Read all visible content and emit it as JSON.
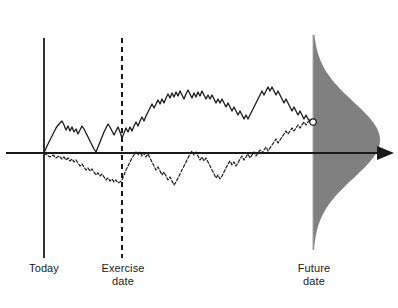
{
  "figure": {
    "background_color": "#ffffff",
    "ink_color": "#1a1a1a",
    "distribution_fill_color": "#808080"
  },
  "labels": {
    "today": "Today",
    "exercise_date": "Exercise\ndate",
    "future_date": "Future\ndate"
  },
  "caption": {
    "partial_text": ""
  },
  "chart_data": {
    "type": "line",
    "title": "",
    "xlabel": "",
    "ylabel": "",
    "grid": false,
    "legend_position": "none",
    "axis": {
      "horizontal_y_px": 153,
      "x_start_px": 6,
      "x_end_px": 394,
      "arrow_at_end": true
    },
    "markers": [
      {
        "name": "today-line",
        "label": "Today",
        "x_px": 44,
        "style": "solid-vertical",
        "y_top_px": 38,
        "y_bottom_px": 258
      },
      {
        "name": "exercise-date-line",
        "label": "Exercise date",
        "x_px": 122,
        "style": "dashed-vertical",
        "y_top_px": 38,
        "y_bottom_px": 258
      },
      {
        "name": "future-date-line",
        "label": "Future date",
        "x_px": 313,
        "style": "thin-vertical",
        "y_top_px": 35,
        "y_bottom_px": 250
      }
    ],
    "endpoint_marker": {
      "name": "path-endpoint",
      "x_px": 313,
      "y_px": 122,
      "shape": "open-circle"
    },
    "series": [
      {
        "name": "upper-path-solid",
        "style": "solid",
        "points_px": [
          [
            44,
            153
          ],
          [
            47,
            146
          ],
          [
            50,
            140
          ],
          [
            53,
            134
          ],
          [
            56,
            128
          ],
          [
            59,
            124
          ],
          [
            62,
            121
          ],
          [
            64,
            125
          ],
          [
            66,
            130
          ],
          [
            68,
            126
          ],
          [
            70,
            131
          ],
          [
            72,
            127
          ],
          [
            74,
            132
          ],
          [
            76,
            129
          ],
          [
            78,
            134
          ],
          [
            80,
            130
          ],
          [
            82,
            126
          ],
          [
            84,
            129
          ],
          [
            86,
            133
          ],
          [
            88,
            137
          ],
          [
            90,
            141
          ],
          [
            92,
            145
          ],
          [
            94,
            149
          ],
          [
            96,
            152
          ],
          [
            98,
            147
          ],
          [
            100,
            142
          ],
          [
            102,
            137
          ],
          [
            104,
            132
          ],
          [
            106,
            128
          ],
          [
            108,
            124
          ],
          [
            110,
            127
          ],
          [
            112,
            131
          ],
          [
            114,
            135
          ],
          [
            116,
            131
          ],
          [
            118,
            127
          ],
          [
            120,
            132
          ],
          [
            122,
            138
          ],
          [
            124,
            133
          ],
          [
            126,
            128
          ],
          [
            128,
            132
          ],
          [
            130,
            127
          ],
          [
            132,
            131
          ],
          [
            134,
            126
          ],
          [
            136,
            122
          ],
          [
            138,
            126
          ],
          [
            140,
            121
          ],
          [
            142,
            117
          ],
          [
            144,
            121
          ],
          [
            146,
            116
          ],
          [
            148,
            112
          ],
          [
            150,
            108
          ],
          [
            152,
            104
          ],
          [
            154,
            108
          ],
          [
            156,
            104
          ],
          [
            158,
            100
          ],
          [
            160,
            104
          ],
          [
            162,
            99
          ],
          [
            164,
            103
          ],
          [
            166,
            98
          ],
          [
            168,
            94
          ],
          [
            170,
            98
          ],
          [
            172,
            93
          ],
          [
            174,
            97
          ],
          [
            176,
            92
          ],
          [
            178,
            96
          ],
          [
            180,
            91
          ],
          [
            182,
            95
          ],
          [
            184,
            99
          ],
          [
            186,
            94
          ],
          [
            188,
            90
          ],
          [
            190,
            94
          ],
          [
            192,
            98
          ],
          [
            194,
            93
          ],
          [
            196,
            97
          ],
          [
            198,
            92
          ],
          [
            200,
            96
          ],
          [
            202,
            91
          ],
          [
            204,
            95
          ],
          [
            206,
            99
          ],
          [
            208,
            95
          ],
          [
            210,
            99
          ],
          [
            212,
            95
          ],
          [
            214,
            99
          ],
          [
            216,
            103
          ],
          [
            218,
            99
          ],
          [
            220,
            103
          ],
          [
            222,
            99
          ],
          [
            224,
            103
          ],
          [
            226,
            107
          ],
          [
            228,
            103
          ],
          [
            230,
            107
          ],
          [
            232,
            111
          ],
          [
            234,
            107
          ],
          [
            236,
            111
          ],
          [
            238,
            115
          ],
          [
            240,
            111
          ],
          [
            242,
            115
          ],
          [
            244,
            119
          ],
          [
            246,
            115
          ],
          [
            248,
            119
          ],
          [
            250,
            115
          ],
          [
            252,
            111
          ],
          [
            254,
            107
          ],
          [
            256,
            103
          ],
          [
            258,
            99
          ],
          [
            260,
            95
          ],
          [
            262,
            91
          ],
          [
            264,
            95
          ],
          [
            266,
            91
          ],
          [
            268,
            87
          ],
          [
            270,
            91
          ],
          [
            272,
            87
          ],
          [
            274,
            91
          ],
          [
            276,
            95
          ],
          [
            278,
            91
          ],
          [
            280,
            95
          ],
          [
            282,
            99
          ],
          [
            284,
            103
          ],
          [
            286,
            99
          ],
          [
            288,
            103
          ],
          [
            290,
            107
          ],
          [
            292,
            111
          ],
          [
            294,
            107
          ],
          [
            296,
            111
          ],
          [
            298,
            115
          ],
          [
            300,
            111
          ],
          [
            302,
            115
          ],
          [
            304,
            119
          ],
          [
            306,
            115
          ],
          [
            308,
            119
          ],
          [
            310,
            121
          ],
          [
            313,
            122
          ]
        ]
      },
      {
        "name": "lower-path-dashed",
        "style": "dashed",
        "points_px": [
          [
            44,
            153
          ],
          [
            47,
            155
          ],
          [
            50,
            157
          ],
          [
            53,
            155
          ],
          [
            56,
            158
          ],
          [
            59,
            156
          ],
          [
            62,
            159
          ],
          [
            64,
            157
          ],
          [
            66,
            160
          ],
          [
            68,
            158
          ],
          [
            70,
            161
          ],
          [
            72,
            159
          ],
          [
            74,
            162
          ],
          [
            76,
            160
          ],
          [
            78,
            163
          ],
          [
            80,
            166
          ],
          [
            82,
            164
          ],
          [
            84,
            167
          ],
          [
            86,
            170
          ],
          [
            88,
            168
          ],
          [
            90,
            171
          ],
          [
            92,
            169
          ],
          [
            94,
            172
          ],
          [
            96,
            175
          ],
          [
            98,
            173
          ],
          [
            100,
            176
          ],
          [
            102,
            174
          ],
          [
            104,
            177
          ],
          [
            106,
            180
          ],
          [
            108,
            178
          ],
          [
            110,
            181
          ],
          [
            112,
            179
          ],
          [
            114,
            182
          ],
          [
            116,
            180
          ],
          [
            118,
            183
          ],
          [
            120,
            182
          ],
          [
            122,
            180
          ],
          [
            124,
            175
          ],
          [
            126,
            170
          ],
          [
            128,
            166
          ],
          [
            130,
            162
          ],
          [
            132,
            158
          ],
          [
            134,
            155
          ],
          [
            136,
            152
          ],
          [
            138,
            155
          ],
          [
            140,
            152
          ],
          [
            142,
            156
          ],
          [
            144,
            153
          ],
          [
            146,
            157
          ],
          [
            148,
            154
          ],
          [
            150,
            158
          ],
          [
            152,
            162
          ],
          [
            154,
            166
          ],
          [
            156,
            170
          ],
          [
            158,
            167
          ],
          [
            160,
            171
          ],
          [
            162,
            175
          ],
          [
            164,
            172
          ],
          [
            166,
            176
          ],
          [
            168,
            180
          ],
          [
            170,
            177
          ],
          [
            172,
            181
          ],
          [
            174,
            185
          ],
          [
            176,
            182
          ],
          [
            178,
            178
          ],
          [
            180,
            174
          ],
          [
            182,
            170
          ],
          [
            184,
            166
          ],
          [
            186,
            162
          ],
          [
            188,
            158
          ],
          [
            190,
            154
          ],
          [
            192,
            151
          ],
          [
            194,
            155
          ],
          [
            196,
            152
          ],
          [
            198,
            156
          ],
          [
            200,
            160
          ],
          [
            202,
            157
          ],
          [
            204,
            161
          ],
          [
            206,
            158
          ],
          [
            208,
            162
          ],
          [
            210,
            166
          ],
          [
            212,
            170
          ],
          [
            214,
            174
          ],
          [
            216,
            178
          ],
          [
            218,
            175
          ],
          [
            220,
            179
          ],
          [
            222,
            176
          ],
          [
            224,
            172
          ],
          [
            226,
            168
          ],
          [
            228,
            164
          ],
          [
            230,
            161
          ],
          [
            232,
            165
          ],
          [
            234,
            162
          ],
          [
            236,
            166
          ],
          [
            238,
            163
          ],
          [
            240,
            159
          ],
          [
            242,
            156
          ],
          [
            244,
            160
          ],
          [
            246,
            157
          ],
          [
            248,
            154
          ],
          [
            250,
            158
          ],
          [
            252,
            155
          ],
          [
            254,
            152
          ],
          [
            256,
            156
          ],
          [
            258,
            153
          ],
          [
            260,
            150
          ],
          [
            262,
            153
          ],
          [
            264,
            150
          ],
          [
            266,
            147
          ],
          [
            268,
            151
          ],
          [
            270,
            148
          ],
          [
            272,
            145
          ],
          [
            274,
            142
          ],
          [
            276,
            139
          ],
          [
            278,
            143
          ],
          [
            280,
            140
          ],
          [
            282,
            137
          ],
          [
            284,
            134
          ],
          [
            286,
            131
          ],
          [
            288,
            134
          ],
          [
            290,
            131
          ],
          [
            292,
            128
          ],
          [
            294,
            131
          ],
          [
            296,
            128
          ],
          [
            298,
            125
          ],
          [
            300,
            128
          ],
          [
            302,
            125
          ],
          [
            304,
            122
          ],
          [
            306,
            125
          ],
          [
            308,
            122
          ],
          [
            310,
            120
          ],
          [
            313,
            122
          ]
        ]
      }
    ],
    "distribution": {
      "name": "future-date-distribution",
      "type": "normal-density-sideways",
      "orientation": "horizontal-density-vertical-axis",
      "baseline_x_px": 313,
      "mean_y_px": 140,
      "std_dev_px": 38,
      "peak_x_px": 380,
      "y_top_px": 35,
      "y_bottom_px": 250,
      "fill": "#808080"
    }
  }
}
